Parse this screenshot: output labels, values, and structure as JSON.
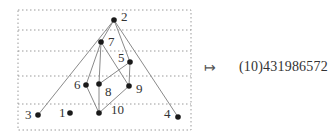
{
  "diagram": {
    "frame": {
      "x": 18,
      "y": 10,
      "width": 173,
      "height": 120
    },
    "level_lines_y": [
      30,
      51,
      76,
      104
    ],
    "nodes": [
      {
        "id": "1",
        "label": "1",
        "x": 70,
        "y": 113,
        "label_dx": -11,
        "label_dy": 4
      },
      {
        "id": "2",
        "label": "2",
        "x": 114,
        "y": 20,
        "label_dx": 7,
        "label_dy": 1
      },
      {
        "id": "3",
        "label": "3",
        "x": 38,
        "y": 115,
        "label_dx": -13,
        "label_dy": 4
      },
      {
        "id": "4",
        "label": "4",
        "x": 178,
        "y": 117,
        "label_dx": -14,
        "label_dy": 1
      },
      {
        "id": "5",
        "label": "5",
        "x": 130,
        "y": 62,
        "label_dx": -12,
        "label_dy": 0
      },
      {
        "id": "6",
        "label": "6",
        "x": 86,
        "y": 85,
        "label_dx": -12,
        "label_dy": 4
      },
      {
        "id": "7",
        "label": "7",
        "x": 101,
        "y": 42,
        "label_dx": 7,
        "label_dy": 4
      },
      {
        "id": "8",
        "label": "8",
        "x": 99,
        "y": 84,
        "label_dx": 6,
        "label_dy": 12
      },
      {
        "id": "9",
        "label": "9",
        "x": 129,
        "y": 86,
        "label_dx": 7,
        "label_dy": 7
      },
      {
        "id": "10",
        "label": "10",
        "x": 99,
        "y": 113,
        "label_dx": 12,
        "label_dy": 1
      }
    ],
    "edges": [
      [
        "2",
        "3"
      ],
      [
        "2",
        "7"
      ],
      [
        "2",
        "5"
      ],
      [
        "2",
        "4"
      ],
      [
        "7",
        "6"
      ],
      [
        "7",
        "8"
      ],
      [
        "7",
        "9"
      ],
      [
        "5",
        "8"
      ],
      [
        "5",
        "9"
      ],
      [
        "6",
        "10"
      ],
      [
        "8",
        "10"
      ],
      [
        "9",
        "10"
      ]
    ],
    "colors": {
      "node": "#1a1a1a",
      "edge": "#8a8a8a",
      "dotted": "#9a9a9a"
    }
  },
  "mapping": {
    "arrow": "↦",
    "result": "(10)431986572"
  }
}
